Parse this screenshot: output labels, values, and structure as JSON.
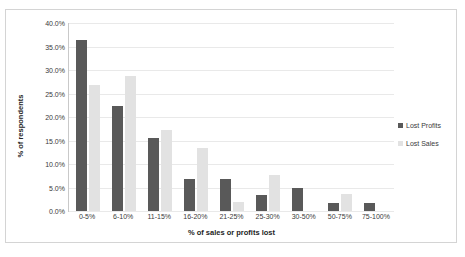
{
  "chart_data": {
    "type": "bar",
    "title": "",
    "xlabel": "% of sales or profits lost",
    "ylabel": "% of respondents",
    "categories": [
      "0-5%",
      "6-10%",
      "11-15%",
      "16-20%",
      "21-25%",
      "25-30%",
      "30-50%",
      "50-75%",
      "75-100%"
    ],
    "series": [
      {
        "name": "Lost Profits",
        "color": "#595959",
        "values": [
          36.3,
          22.4,
          15.5,
          6.9,
          6.9,
          3.4,
          5.0,
          1.7,
          1.7
        ]
      },
      {
        "name": "Lost Sales",
        "color": "#e2e2e2",
        "values": [
          26.8,
          28.7,
          17.2,
          13.4,
          1.9,
          7.6,
          0,
          3.6,
          0
        ]
      }
    ],
    "ylim": [
      0,
      40
    ],
    "ytick_values": [
      40,
      35,
      30,
      25,
      20,
      15,
      10,
      5,
      0
    ],
    "ytick_labels": [
      "40.0%",
      "35.0%",
      "30.0%",
      "25.0%",
      "20.0%",
      "15.0%",
      "10.0%",
      "5.0%",
      "0.0%"
    ],
    "grid": true,
    "grid_axis": "y",
    "legend_position": "right",
    "bar_orientation": "vertical"
  },
  "legend": {
    "items": [
      {
        "label": "Lost Profits",
        "marker": "legend-swatch-dark"
      },
      {
        "label": "Lost Sales",
        "marker": "legend-swatch-light"
      }
    ]
  },
  "axes": {
    "y_title": "% of respondents",
    "x_title": "% of sales or profits lost"
  }
}
